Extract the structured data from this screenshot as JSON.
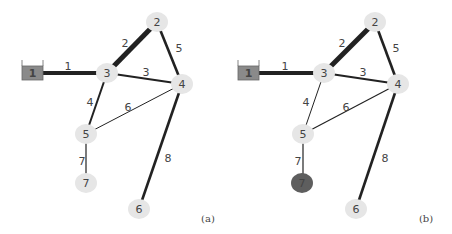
{
  "figure": {
    "panels": [
      {
        "id": "a",
        "label": "(a)",
        "label_pos": [
          208,
          218
        ],
        "tank": {
          "id": "1",
          "label": "1",
          "x": 22,
          "y": 66,
          "w": 21,
          "h": 14,
          "fill": "#8a8a8a"
        },
        "nodes": [
          {
            "id": "2",
            "label": "2",
            "x": 157,
            "y": 22,
            "fill": "#e6e6e6"
          },
          {
            "id": "3",
            "label": "3",
            "x": 107,
            "y": 73,
            "fill": "#e6e6e6"
          },
          {
            "id": "4",
            "label": "4",
            "x": 182,
            "y": 84,
            "fill": "#e6e6e6"
          },
          {
            "id": "5",
            "label": "5",
            "x": 86,
            "y": 134,
            "fill": "#e6e6e6"
          },
          {
            "id": "6",
            "label": "6",
            "x": 139,
            "y": 209,
            "fill": "#e6e6e6"
          },
          {
            "id": "7",
            "label": "7",
            "x": 86,
            "y": 183,
            "fill": "#e6e6e6"
          }
        ],
        "edges": [
          {
            "id": "1",
            "label": "1",
            "from": [
              43,
              73
            ],
            "to": [
              107,
              73
            ],
            "width": 4,
            "label_pos": [
              68,
              66
            ]
          },
          {
            "id": "2",
            "label": "2",
            "from": [
              107,
              73
            ],
            "to": [
              157,
              22
            ],
            "width": 5,
            "label_pos": [
              125,
              43
            ]
          },
          {
            "id": "3",
            "label": "3",
            "from": [
              107,
              73
            ],
            "to": [
              182,
              84
            ],
            "width": 2.2,
            "label_pos": [
              146,
              72
            ]
          },
          {
            "id": "4",
            "label": "4",
            "from": [
              107,
              73
            ],
            "to": [
              86,
              134
            ],
            "width": 2,
            "label_pos": [
              90,
              102
            ]
          },
          {
            "id": "5",
            "label": "5",
            "from": [
              157,
              22
            ],
            "to": [
              182,
              84
            ],
            "width": 2.6,
            "label_pos": [
              179,
              48
            ]
          },
          {
            "id": "6",
            "label": "6",
            "from": [
              182,
              84
            ],
            "to": [
              86,
              134
            ],
            "width": 1,
            "label_pos": [
              128,
              107
            ]
          },
          {
            "id": "7",
            "label": "7",
            "from": [
              86,
              134
            ],
            "to": [
              86,
              183
            ],
            "width": 1.2,
            "label_pos": [
              82,
              161
            ]
          },
          {
            "id": "8",
            "label": "8",
            "from": [
              182,
              84
            ],
            "to": [
              139,
              209
            ],
            "width": 2.6,
            "label_pos": [
              168,
              158
            ]
          }
        ]
      },
      {
        "id": "b",
        "label": "(b)",
        "label_pos": [
          426,
          218
        ],
        "tank": {
          "id": "1",
          "label": "1",
          "x": 238,
          "y": 66,
          "w": 21,
          "h": 14,
          "fill": "#8a8a8a"
        },
        "nodes": [
          {
            "id": "2",
            "label": "2",
            "x": 375,
            "y": 22,
            "fill": "#e6e6e6"
          },
          {
            "id": "3",
            "label": "3",
            "x": 324,
            "y": 73,
            "fill": "#e6e6e6"
          },
          {
            "id": "4",
            "label": "4",
            "x": 398,
            "y": 84,
            "fill": "#e6e6e6"
          },
          {
            "id": "5",
            "label": "5",
            "x": 303,
            "y": 134,
            "fill": "#e6e6e6"
          },
          {
            "id": "6",
            "label": "6",
            "x": 356,
            "y": 209,
            "fill": "#e6e6e6"
          },
          {
            "id": "7",
            "label": "7",
            "x": 302,
            "y": 183,
            "fill": "#5e5e5e"
          }
        ],
        "edges": [
          {
            "id": "1",
            "label": "1",
            "from": [
              259,
              73
            ],
            "to": [
              324,
              73
            ],
            "width": 4,
            "label_pos": [
              285,
              66
            ]
          },
          {
            "id": "2",
            "label": "2",
            "from": [
              324,
              73
            ],
            "to": [
              375,
              22
            ],
            "width": 5,
            "label_pos": [
              342,
              43
            ]
          },
          {
            "id": "3",
            "label": "3",
            "from": [
              324,
              73
            ],
            "to": [
              398,
              84
            ],
            "width": 2.2,
            "label_pos": [
              363,
              72
            ]
          },
          {
            "id": "4",
            "label": "4",
            "from": [
              324,
              73
            ],
            "to": [
              303,
              134
            ],
            "width": 1,
            "label_pos": [
              306,
              102
            ]
          },
          {
            "id": "5",
            "label": "5",
            "from": [
              375,
              22
            ],
            "to": [
              398,
              84
            ],
            "width": 2.6,
            "label_pos": [
              396,
              48
            ]
          },
          {
            "id": "6",
            "label": "6",
            "from": [
              398,
              84
            ],
            "to": [
              303,
              134
            ],
            "width": 1.2,
            "label_pos": [
              346,
              107
            ]
          },
          {
            "id": "7",
            "label": "7",
            "from": [
              303,
              134
            ],
            "to": [
              303,
              183
            ],
            "width": 1.2,
            "label_pos": [
              298,
              161
            ]
          },
          {
            "id": "8",
            "label": "8",
            "from": [
              398,
              84
            ],
            "to": [
              356,
              209
            ],
            "width": 2.6,
            "label_pos": [
              385,
              158
            ]
          }
        ]
      }
    ],
    "colors": {
      "edge": "#222222",
      "node_fill": "#e6e6e6",
      "node_highlight": "#5e5e5e",
      "tank_fill": "#8a8a8a",
      "text": "#444444"
    }
  }
}
